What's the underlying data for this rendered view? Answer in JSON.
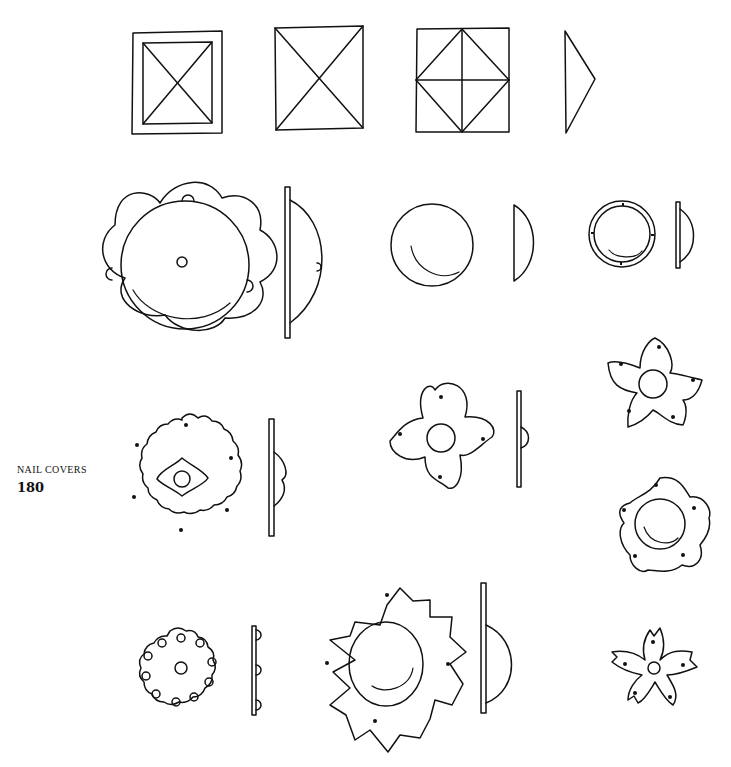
{
  "page": {
    "caption": {
      "title": "NAIL COVERS",
      "number": "180"
    },
    "colors": {
      "ink": "#111111",
      "paper": "#ffffff"
    },
    "figures": [
      {
        "id": "square-framed-pyramid",
        "row": 1
      },
      {
        "id": "square-pyramid",
        "row": 1
      },
      {
        "id": "square-diamond-faceted",
        "row": 1
      },
      {
        "id": "pyramid-profile",
        "row": 1
      },
      {
        "id": "lobed-domed-cover",
        "row": 2
      },
      {
        "id": "lobed-domed-cover-profile",
        "row": 2
      },
      {
        "id": "plain-dome",
        "row": 2
      },
      {
        "id": "plain-dome-profile",
        "row": 2
      },
      {
        "id": "ringed-dome",
        "row": 2
      },
      {
        "id": "ringed-dome-profile",
        "row": 2
      },
      {
        "id": "four-petal-cover",
        "row": 3
      },
      {
        "id": "four-petal-cover-profile",
        "row": 3
      },
      {
        "id": "five-petal-cover",
        "row": 3
      },
      {
        "id": "scalloped-rosette",
        "row": 4
      },
      {
        "id": "scalloped-rosette-profile",
        "row": 4
      },
      {
        "id": "wavy-five-petal-dome",
        "row": 4
      },
      {
        "id": "dotted-rosette",
        "row": 5
      },
      {
        "id": "dotted-rosette-profile",
        "row": 5
      },
      {
        "id": "sunflower-dome",
        "row": 5
      },
      {
        "id": "sunflower-dome-profile",
        "row": 5
      },
      {
        "id": "cherry-blossom",
        "row": 5
      }
    ]
  }
}
